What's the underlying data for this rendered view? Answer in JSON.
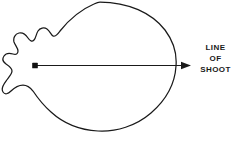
{
  "figure": {
    "title": "",
    "background_color": "#ffffff",
    "stroke_color": "#1a1a1a",
    "annotation": {
      "lines": [
        "LINE",
        "OF",
        "SHOOT"
      ],
      "line1": "LINE",
      "line2": "OF",
      "line3": "SHOOT"
    },
    "arrow": {
      "origin_x": 35,
      "origin_y": 65,
      "tip_x": 191,
      "tip_y": 65,
      "direction": "right"
    },
    "shape": {
      "name": "shot-pattern-outline",
      "description": "pear-shaped outline with rounded right body and irregular lobed left end"
    }
  }
}
